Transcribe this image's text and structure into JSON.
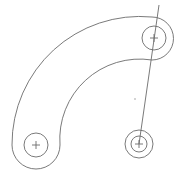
{
  "drawing": {
    "type": "cad-sketch",
    "line_color": "#6b6b6b",
    "background": "#ffffff",
    "slot": {
      "arc_center": [
        140,
        145
      ],
      "outer_radius": 128,
      "inner_radius": 80,
      "start_end_center": [
        36,
        145
      ],
      "start_end_radius": 24,
      "finish_end_center": [
        154,
        38
      ],
      "finish_end_radius": 20
    },
    "holes": [
      {
        "name": "hole-bottom-left",
        "center": [
          36,
          145
        ],
        "radius": 12
      },
      {
        "name": "hole-top-right",
        "center": [
          154,
          38
        ],
        "radius": 12
      },
      {
        "name": "hole-bottom-right-outer",
        "center": [
          139,
          144
        ],
        "radius": 14
      },
      {
        "name": "hole-bottom-right-inner",
        "center": [
          139,
          144
        ],
        "radius": 8
      }
    ],
    "construction_line": {
      "from": [
        159,
        5
      ],
      "to": [
        139,
        144
      ]
    },
    "point": [
      135,
      99
    ]
  }
}
